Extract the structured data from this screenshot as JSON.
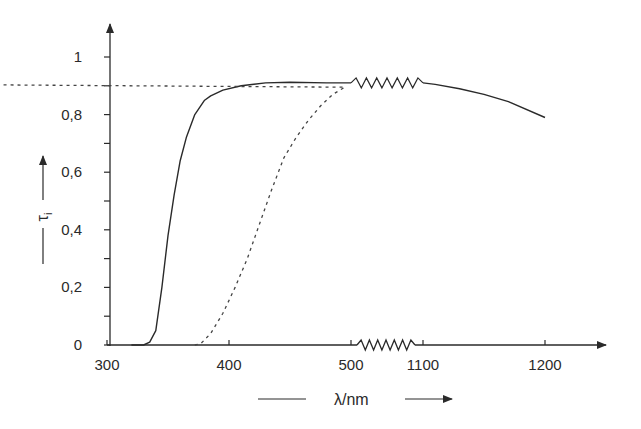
{
  "chart_data": {
    "type": "line",
    "title": "",
    "xlabel": "λ/nm",
    "ylabel": "τi",
    "ylabel_symbol": "τ",
    "ylabel_subscript": "i",
    "x_axis_break": {
      "from": 500,
      "to": 1100
    },
    "xlim": [
      300,
      1260
    ],
    "ylim": [
      0,
      1.1
    ],
    "x_ticks": [
      300,
      400,
      500,
      1100,
      1200
    ],
    "x_tick_labels": [
      "300",
      "400",
      "500",
      "1100",
      "1200"
    ],
    "y_ticks": [
      0,
      0.1,
      0.2,
      0.3,
      0.4,
      0.5,
      0.6,
      0.7,
      0.8,
      0.9,
      1.0
    ],
    "y_tick_labels": [
      "0",
      "0,2",
      "0,4",
      "0,6",
      "0,8",
      "1"
    ],
    "y_labeled_ticks": [
      0,
      0.2,
      0.4,
      0.6,
      0.8,
      1.0
    ],
    "grid": false,
    "legend": null,
    "series": [
      {
        "name": "solid curve",
        "style": "solid",
        "x": [
          320,
          330,
          335,
          340,
          345,
          350,
          355,
          360,
          365,
          372,
          380,
          385,
          395,
          410,
          430,
          450,
          480,
          500,
          1100,
          1110,
          1130,
          1150,
          1170,
          1200
        ],
        "values": [
          0,
          0,
          0.01,
          0.05,
          0.2,
          0.38,
          0.52,
          0.64,
          0.72,
          0.8,
          0.85,
          0.865,
          0.885,
          0.9,
          0.91,
          0.912,
          0.91,
          0.91,
          0.91,
          0.905,
          0.89,
          0.87,
          0.845,
          0.79
        ]
      },
      {
        "name": "dashed curve",
        "style": "dashed",
        "x": [
          372,
          377,
          385,
          395,
          405,
          415,
          425,
          435,
          445,
          455,
          465,
          475,
          485,
          495,
          507
        ],
        "values": [
          0,
          0.005,
          0.04,
          0.11,
          0.2,
          0.3,
          0.42,
          0.54,
          0.65,
          0.72,
          0.78,
          0.83,
          0.87,
          0.895,
          0.91
        ]
      }
    ]
  },
  "axis": {
    "x_label": "λ/nm",
    "y_symbol": "τ",
    "y_subscript": "i"
  }
}
